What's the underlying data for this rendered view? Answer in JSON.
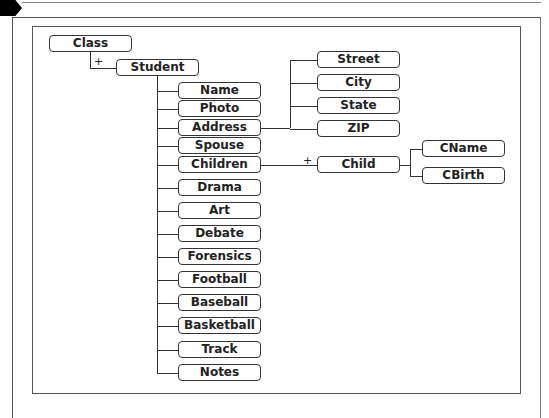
{
  "diagram": {
    "root": "Class",
    "child_marker": "+",
    "entity": "Student",
    "attributes": [
      "Name",
      "Photo",
      "Address",
      "Spouse",
      "Children",
      "Drama",
      "Art",
      "Debate",
      "Forensics",
      "Football",
      "Baseball",
      "Basketball",
      "Track",
      "Notes"
    ],
    "address_fields": [
      "Street",
      "City",
      "State",
      "ZIP"
    ],
    "children_entity": "Child",
    "child_fields": [
      "CName",
      "CBirth"
    ]
  }
}
